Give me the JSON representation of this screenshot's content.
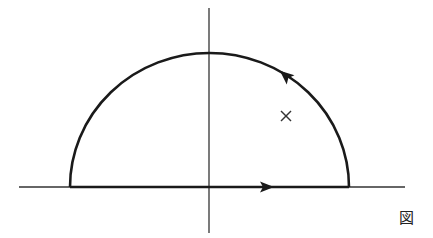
{
  "figure": {
    "label": "図",
    "axes": {
      "horizontal": {
        "x1": 19,
        "x2": 405,
        "y": 187
      },
      "vertical": {
        "x": 209,
        "y1": 8,
        "y2": 233
      }
    },
    "contour": {
      "center": [
        209.5,
        187
      ],
      "rx": 139.5,
      "ry": 134,
      "direction": "counterclockwise",
      "arrows": [
        {
          "segment": "real-axis",
          "position": [
            268,
            187
          ],
          "direction": "right"
        },
        {
          "segment": "arc",
          "position": [
            287,
            77
          ],
          "direction": "up-left"
        }
      ]
    },
    "pole": {
      "marker": "×",
      "position": [
        286,
        116
      ]
    },
    "colors": {
      "stroke": "#1a1a1a",
      "axis": "#333333",
      "background": "#ffffff"
    }
  }
}
